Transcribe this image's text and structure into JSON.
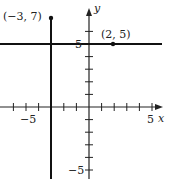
{
  "chart_data": {
    "type": "line",
    "title": "",
    "xlabel": "x",
    "ylabel": "y",
    "xlim": [
      -7,
      6
    ],
    "ylim": [
      -5,
      8
    ],
    "x_ticks": [
      -6,
      -5,
      -4,
      -3,
      -2,
      -1,
      1,
      2,
      3,
      4,
      5
    ],
    "y_ticks": [
      -5,
      -4,
      -3,
      -2,
      -1,
      1,
      2,
      3,
      4,
      5,
      6
    ],
    "x_tick_labels": [
      {
        "value": -5,
        "label": "−5"
      },
      {
        "value": 5,
        "label": "5"
      }
    ],
    "y_tick_labels": [
      {
        "value": 5,
        "label": "5"
      },
      {
        "value": -5,
        "label": "−5"
      }
    ],
    "series": [
      {
        "name": "x = -3",
        "kind": "vertical-line",
        "x": -3
      },
      {
        "name": "y = 5",
        "kind": "horizontal-line",
        "y": 5
      }
    ],
    "points": [
      {
        "x": -3,
        "y": 7,
        "label": "(−3, 7)"
      },
      {
        "x": 2,
        "y": 5,
        "label": "(2, 5)"
      }
    ],
    "grid": false,
    "legend": null
  },
  "labels": {
    "x_axis": "x",
    "y_axis": "y",
    "x_neg5": "−5",
    "x_pos5": "5",
    "y_pos5": "5",
    "y_neg5": "−5",
    "pt1": "(−3, 7)",
    "pt2": "(2, 5)"
  }
}
